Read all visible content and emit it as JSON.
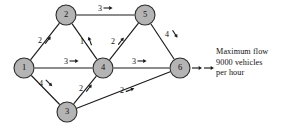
{
  "figure": {
    "colors": {
      "node_fill": "#b4b4b4",
      "node_stroke": "#2b2b2b",
      "edge": "#1a1a1a",
      "text": "#111111",
      "background": "#ffffff"
    }
  },
  "nodes": [
    {
      "id": "1",
      "label": "1",
      "x": 24,
      "y": 68,
      "r": 10
    },
    {
      "id": "2",
      "label": "2",
      "x": 66,
      "y": 15,
      "r": 10
    },
    {
      "id": "3",
      "label": "3",
      "x": 67,
      "y": 112,
      "r": 10
    },
    {
      "id": "4",
      "label": "4",
      "x": 103,
      "y": 68,
      "r": 10
    },
    {
      "id": "5",
      "label": "5",
      "x": 145,
      "y": 15,
      "r": 10
    },
    {
      "id": "6",
      "label": "6",
      "x": 180,
      "y": 68,
      "r": 10
    }
  ],
  "edges": [
    {
      "from": "1",
      "to": "2",
      "label": "2",
      "label_x": 40,
      "label_y": 41,
      "arrow_angle_deg": -52
    },
    {
      "from": "1",
      "to": "4",
      "label": "3",
      "label_x": 66,
      "label_y": 62,
      "arrow_angle_deg": 0
    },
    {
      "from": "1",
      "to": "3",
      "label": "4",
      "label_x": 41,
      "label_y": 84,
      "arrow_angle_deg": 45
    },
    {
      "from": "2",
      "to": "5",
      "label": "3",
      "label_x": 100,
      "label_y": 9,
      "arrow_angle_deg": 0
    },
    {
      "from": "4",
      "to": "2",
      "label": "1",
      "label_x": 82,
      "label_y": 42,
      "arrow_angle_deg": -110
    },
    {
      "from": "4",
      "to": "5",
      "label": "2",
      "label_x": 113,
      "label_y": 42,
      "arrow_angle_deg": -52
    },
    {
      "from": "5",
      "to": "6",
      "label": "4",
      "label_x": 167,
      "label_y": 35,
      "arrow_angle_deg": 57
    },
    {
      "from": "4",
      "to": "6",
      "label": "3",
      "label_x": 134,
      "label_y": 62,
      "arrow_angle_deg": 0
    },
    {
      "from": "3",
      "to": "4",
      "label": "2",
      "label_x": 81,
      "label_y": 89,
      "arrow_angle_deg": -52
    },
    {
      "from": "3",
      "to": "6",
      "label": "2",
      "label_x": 122,
      "label_y": 91,
      "arrow_angle_deg": -21
    }
  ],
  "output_arrow": {
    "name": "output-flow-arrow",
    "from_x": 192,
    "to_x": 214,
    "y": 68
  },
  "annotation": {
    "line1": "Maximum flow",
    "line2": "9000 vehicles",
    "line3": "per hour"
  }
}
